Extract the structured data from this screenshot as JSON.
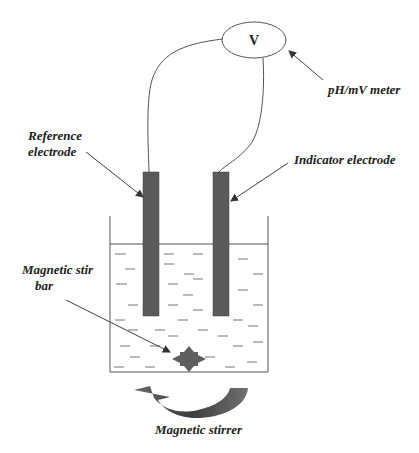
{
  "diagram": {
    "meter_symbol": "V",
    "labels": {
      "meter": "pH/mV meter",
      "reference_line1": "Reference",
      "reference_line2": "electrode",
      "indicator": "Indicator electrode",
      "stir_bar_line1": "Magnetic stir",
      "stir_bar_line2": "bar",
      "stirrer": "Magnetic stirrer"
    },
    "colors": {
      "electrode": "#5a5a5a",
      "line": "#555555",
      "stirrer": "#5f5f5f"
    }
  }
}
